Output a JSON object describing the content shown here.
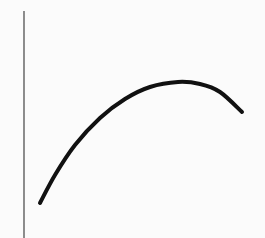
{
  "chart_data": {
    "type": "line",
    "title": "",
    "xlabel": "",
    "ylabel": "",
    "grid": false,
    "legend": null,
    "series": [
      {
        "name": "curve",
        "color": "#111111",
        "points_px": [
          [
            40,
            203
          ],
          [
            55,
            175
          ],
          [
            75,
            145
          ],
          [
            100,
            118
          ],
          [
            125,
            99
          ],
          [
            150,
            87
          ],
          [
            178,
            82
          ],
          [
            200,
            84
          ],
          [
            220,
            92
          ],
          [
            242,
            112
          ]
        ]
      }
    ],
    "axis": {
      "y_axis_x_px": 24,
      "y_axis_top_px": 11,
      "y_axis_bottom_px": 238,
      "color": "#444444"
    }
  }
}
